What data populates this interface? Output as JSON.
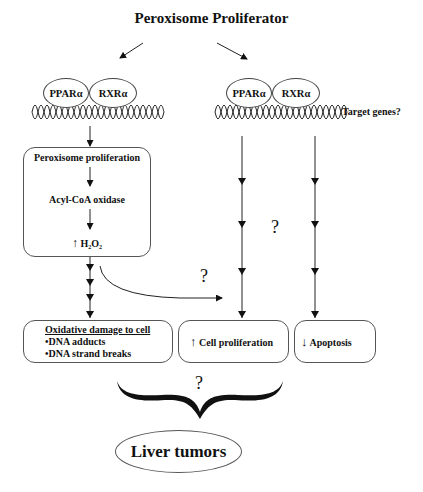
{
  "title": "Peroxisome Proliferator",
  "left_complex": {
    "receptor1": "PPARα",
    "receptor2": "RXRα"
  },
  "right_complex": {
    "receptor1": "PPARα",
    "receptor2": "RXRα",
    "note": "Target genes?"
  },
  "pathway_box": {
    "step1": "Peroxisome proliferation",
    "step2": "Acyl-CoA oxidase",
    "step3_arrow": "↑",
    "step3": "H₂O₂"
  },
  "outcomes": {
    "oxidative": {
      "heading": "Oxidative damage to cell",
      "items": [
        "•DNA adducts",
        "•DNA strand breaks"
      ]
    },
    "proliferation": {
      "arrow": "↑",
      "label": "Cell proliferation"
    },
    "apoptosis": {
      "arrow": "↓",
      "label": "Apoptosis"
    }
  },
  "question_marks": {
    "curve": "?",
    "columns": "?",
    "brace": "?"
  },
  "result": "Liver tumors"
}
